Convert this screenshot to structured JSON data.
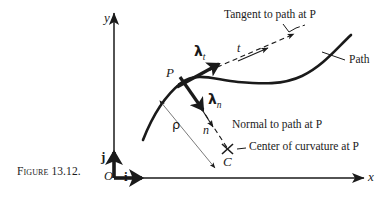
{
  "figure": {
    "caption": "Figure 13.12.",
    "caption_number": "13.12",
    "background_color": "#ffffff",
    "ink_color": "#1a1a1a"
  },
  "axes": {
    "x_label": "x",
    "y_label": "y",
    "origin_label": "O",
    "unit_vector_i": "i",
    "unit_vector_j": "j"
  },
  "points": {
    "P": "P",
    "C": "C"
  },
  "vectors": {
    "lambda_symbol": "λ",
    "tangential_subscript": "t",
    "normal_subscript": "n"
  },
  "directions": {
    "tangent_axis": "t",
    "normal_axis": "n",
    "radius_of_curvature": "ρ"
  },
  "annotations": {
    "tangent": "Tangent to path at P",
    "path": "Path",
    "normal": "Normal to path at P",
    "center_of_curvature": "Center of curvature at P"
  }
}
